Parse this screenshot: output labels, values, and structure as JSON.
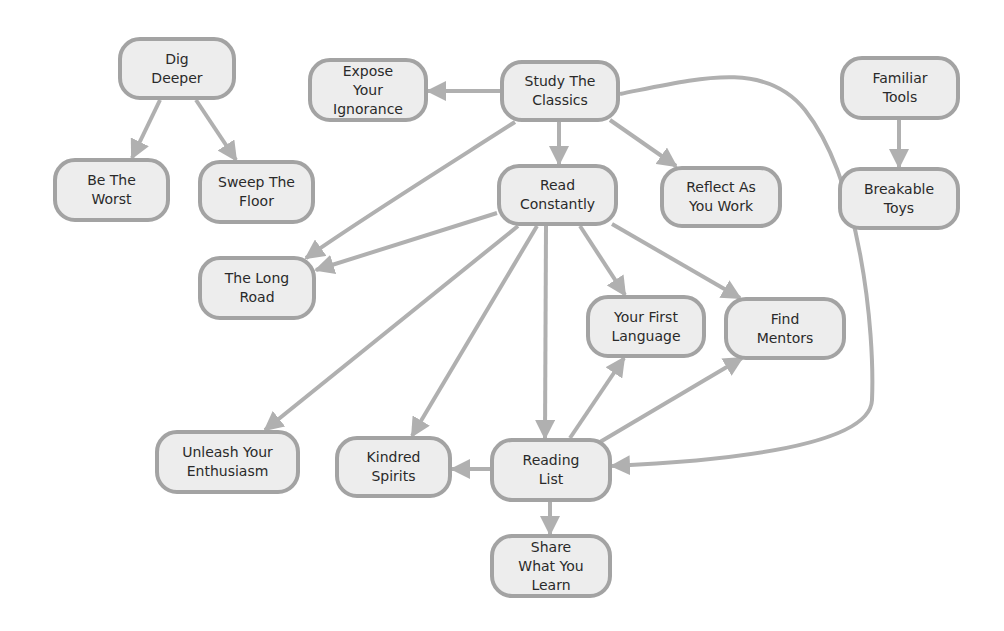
{
  "diagram": {
    "type": "directed-graph",
    "colors": {
      "node_fill": "#ededed",
      "node_border": "#a3a3a3",
      "edge": "#b0b0b0",
      "text": "#2a2a2a"
    },
    "nodes": [
      {
        "id": "dig-deeper",
        "label": "Dig\nDeeper",
        "x": 118,
        "y": 37,
        "w": 118,
        "h": 63
      },
      {
        "id": "expose-your-ignorance",
        "label": "Expose\nYour\nIgnorance",
        "x": 308,
        "y": 58,
        "w": 120,
        "h": 64
      },
      {
        "id": "study-the-classics",
        "label": "Study The\nClassics",
        "x": 500,
        "y": 60,
        "w": 120,
        "h": 62
      },
      {
        "id": "familiar-tools",
        "label": "Familiar\nTools",
        "x": 840,
        "y": 56,
        "w": 120,
        "h": 64
      },
      {
        "id": "be-the-worst",
        "label": "Be The\nWorst",
        "x": 53,
        "y": 158,
        "w": 117,
        "h": 64
      },
      {
        "id": "sweep-the-floor",
        "label": "Sweep The\nFloor",
        "x": 198,
        "y": 160,
        "w": 117,
        "h": 64
      },
      {
        "id": "read-constantly",
        "label": "Read\nConstantly",
        "x": 497,
        "y": 164,
        "w": 121,
        "h": 62
      },
      {
        "id": "reflect-as-you-work",
        "label": "Reflect As\nYou Work",
        "x": 660,
        "y": 166,
        "w": 122,
        "h": 62
      },
      {
        "id": "breakable-toys",
        "label": "Breakable\nToys",
        "x": 838,
        "y": 167,
        "w": 122,
        "h": 63
      },
      {
        "id": "the-long-road",
        "label": "The Long\nRoad",
        "x": 198,
        "y": 256,
        "w": 118,
        "h": 64
      },
      {
        "id": "your-first-language",
        "label": "Your First\nLanguage",
        "x": 586,
        "y": 295,
        "w": 120,
        "h": 63
      },
      {
        "id": "find-mentors",
        "label": "Find\nMentors",
        "x": 724,
        "y": 297,
        "w": 122,
        "h": 63
      },
      {
        "id": "unleash-your-enthusiasm",
        "label": "Unleash Your\nEnthusiasm",
        "x": 155,
        "y": 430,
        "w": 145,
        "h": 64
      },
      {
        "id": "kindred-spirits",
        "label": "Kindred\nSpirits",
        "x": 335,
        "y": 436,
        "w": 117,
        "h": 62
      },
      {
        "id": "reading-list",
        "label": "Reading\nList",
        "x": 490,
        "y": 438,
        "w": 122,
        "h": 64
      },
      {
        "id": "share-what-you-learn",
        "label": "Share\nWhat You\nLearn",
        "x": 490,
        "y": 534,
        "w": 122,
        "h": 64
      }
    ],
    "edges": [
      {
        "from": "dig-deeper",
        "to": "be-the-worst",
        "path": "M160,100 L132,158"
      },
      {
        "from": "dig-deeper",
        "to": "sweep-the-floor",
        "path": "M196,100 L236,160"
      },
      {
        "from": "study-the-classics",
        "to": "expose-your-ignorance",
        "path": "M500,91 L428,91"
      },
      {
        "from": "study-the-classics",
        "to": "read-constantly",
        "path": "M559,122 L559,164"
      },
      {
        "from": "study-the-classics",
        "to": "reflect-as-you-work",
        "path": "M610,120 L676,166"
      },
      {
        "from": "study-the-classics",
        "to": "the-long-road",
        "path": "M515,122 C440,170 360,220 306,258"
      },
      {
        "from": "study-the-classics",
        "to": "reading-list",
        "path": "M620,94 C700,78 765,60 805,110 C860,180 875,330 872,400 C870,450 700,462 612,466"
      },
      {
        "from": "read-constantly",
        "to": "the-long-road",
        "path": "M497,213 L316,270"
      },
      {
        "from": "read-constantly",
        "to": "unleash-your-enthusiasm",
        "path": "M518,226 L265,430"
      },
      {
        "from": "read-constantly",
        "to": "kindred-spirits",
        "path": "M537,226 L412,436"
      },
      {
        "from": "read-constantly",
        "to": "reading-list",
        "path": "M546,226 L545,438"
      },
      {
        "from": "read-constantly",
        "to": "your-first-language",
        "path": "M580,226 L625,295"
      },
      {
        "from": "read-constantly",
        "to": "find-mentors",
        "path": "M612,224 L740,298"
      },
      {
        "from": "reading-list",
        "to": "your-first-language",
        "path": "M570,438 L624,358"
      },
      {
        "from": "reading-list",
        "to": "find-mentors",
        "path": "M600,442 L742,358"
      },
      {
        "from": "reading-list",
        "to": "kindred-spirits",
        "path": "M490,469 L452,469"
      },
      {
        "from": "reading-list",
        "to": "share-what-you-learn",
        "path": "M550,502 L550,534"
      },
      {
        "from": "familiar-tools",
        "to": "breakable-toys",
        "path": "M899,120 L899,167"
      }
    ]
  }
}
